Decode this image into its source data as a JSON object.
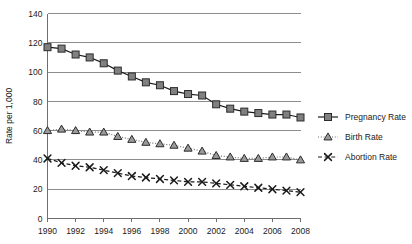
{
  "chart_data": {
    "type": "line",
    "title": "",
    "xlabel": "",
    "ylabel": "Rate per 1,000",
    "xlim": [
      1990,
      2008
    ],
    "ylim": [
      0,
      140
    ],
    "ytick_step": 20,
    "yticks": [
      "0",
      "20",
      "40",
      "60",
      "80",
      "100",
      "120",
      "140"
    ],
    "xticks": [
      "1990",
      "1992",
      "1994",
      "1996",
      "1998",
      "2000",
      "2002",
      "2004",
      "2006",
      "2008"
    ],
    "x": [
      1990,
      1991,
      1992,
      1993,
      1994,
      1995,
      1996,
      1997,
      1998,
      1999,
      2000,
      2001,
      2002,
      2003,
      2004,
      2005,
      2006,
      2007,
      2008
    ],
    "grid": "horizontal",
    "legend_position": "right",
    "series": [
      {
        "name": "Pregnancy Rate",
        "marker": "square",
        "line_style": "solid",
        "color": "#808080",
        "edge_color": "#2b2b2b",
        "values": [
          117,
          116,
          112,
          110,
          106,
          101,
          97,
          93,
          91,
          87,
          85,
          84,
          78,
          75,
          73,
          72,
          71,
          71,
          69
        ]
      },
      {
        "name": "Birth Rate",
        "marker": "triangle",
        "line_style": "dotted",
        "color": "#9a9a9a",
        "edge_color": "#2b2b2b",
        "values": [
          60,
          61,
          60,
          59,
          59,
          56,
          54,
          52,
          51,
          50,
          48,
          46,
          43,
          42,
          41,
          41,
          42,
          42,
          40
        ]
      },
      {
        "name": "Abortion Rate",
        "marker": "x",
        "line_style": "dashed",
        "color": "#1a1a1a",
        "edge_color": "#1a1a1a",
        "values": [
          41,
          38,
          36,
          35,
          33,
          31,
          29,
          28,
          27,
          26,
          25,
          25,
          24,
          23,
          22,
          21,
          20,
          19,
          18
        ]
      }
    ]
  },
  "legend": {
    "items": [
      {
        "label": "Pregnancy Rate"
      },
      {
        "label": "Birth Rate"
      },
      {
        "label": "Abortion Rate"
      }
    ]
  },
  "axes": {
    "y_title": "Rate per 1,000"
  },
  "colors": {
    "pregnancy": "#808080",
    "birth": "#9a9a9a",
    "abortion": "#1a1a1a",
    "grid": "#8c8c8c",
    "axis": "#6e6e6e",
    "background": "#ffffff"
  }
}
